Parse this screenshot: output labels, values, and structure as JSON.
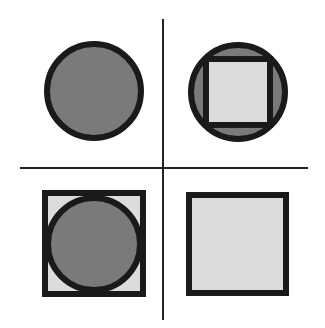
{
  "figure": {
    "width": 325,
    "height": 328,
    "colors": {
      "background": "#ffffff",
      "stroke": "#1a1a1a",
      "dark_fill": "#7a7a7a",
      "light_fill": "#dcdcdc",
      "axis": "#222222"
    },
    "axes": {
      "vertical": {
        "x": 163,
        "y1": 19,
        "y2": 320,
        "width": 2
      },
      "horizontal": {
        "y": 168,
        "x1": 20,
        "x2": 308,
        "width": 2
      }
    },
    "quadrants": [
      {
        "id": "top-left",
        "description": "dark circle",
        "shapes": [
          "circle"
        ]
      },
      {
        "id": "top-right",
        "description": "light square inscribed in dark circle",
        "shapes": [
          "circle",
          "square"
        ]
      },
      {
        "id": "bottom-left",
        "description": "dark circle inscribed in light square",
        "shapes": [
          "square",
          "circle"
        ]
      },
      {
        "id": "bottom-right",
        "description": "light square",
        "shapes": [
          "square"
        ]
      }
    ]
  }
}
